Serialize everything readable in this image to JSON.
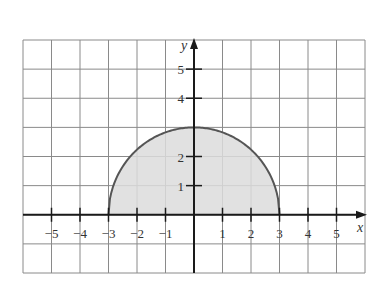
{
  "chart_data": {
    "type": "area",
    "title": "",
    "xlabel": "x",
    "ylabel": "y",
    "xlim": [
      -6,
      6
    ],
    "ylim": [
      -2,
      6
    ],
    "grid": true,
    "x_ticks": [
      -5,
      -4,
      -3,
      -2,
      -1,
      1,
      2,
      3,
      4,
      5
    ],
    "x_tick_labels": [
      "−5",
      "−4",
      "−3",
      "−2",
      "−1",
      "1",
      "2",
      "3",
      "4",
      "5"
    ],
    "y_ticks": [
      1,
      2,
      4,
      5
    ],
    "y_tick_labels": [
      "1",
      "2",
      "4",
      "5"
    ],
    "series": [
      {
        "name": "semicircle",
        "equation": "y = sqrt(9 - x^2)",
        "domain": [
          -3,
          3
        ],
        "x": [
          -3,
          -2,
          -1,
          0,
          1,
          2,
          3
        ],
        "values": [
          0,
          2.24,
          2.83,
          3,
          2.83,
          2.24,
          0
        ],
        "fill": true
      }
    ],
    "colors": {
      "grid": "#8a8a8a",
      "axis": "#1a1a1a",
      "curve": "#555555",
      "fill": "#dcdcdc"
    }
  }
}
